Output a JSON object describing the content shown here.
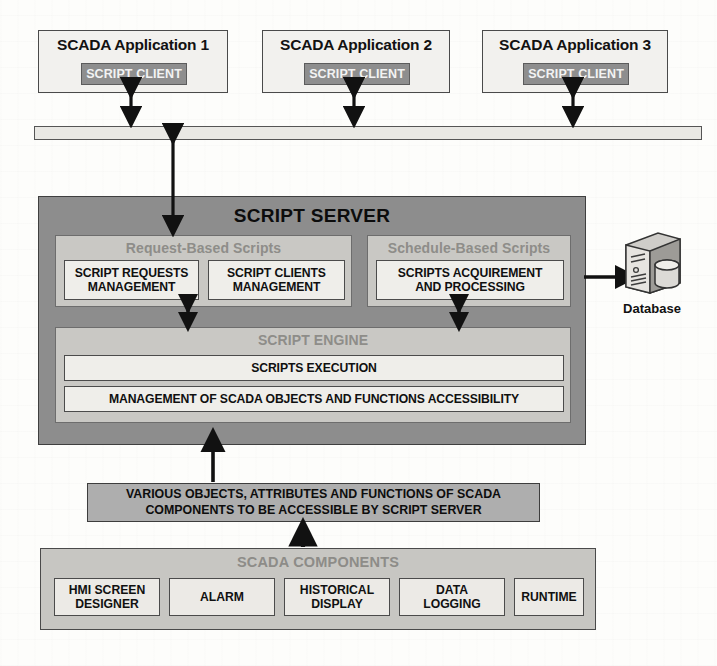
{
  "diagram": {
    "applications": [
      {
        "title": "SCADA Application 1",
        "client_label": "SCRIPT CLIENT"
      },
      {
        "title": "SCADA Application 2",
        "client_label": "SCRIPT CLIENT"
      },
      {
        "title": "SCADA Application 3",
        "client_label": "SCRIPT CLIENT"
      }
    ],
    "network_bus": {
      "label": ""
    },
    "script_server": {
      "title": "SCRIPT SERVER",
      "request_group": {
        "label": "Request-Based Scripts",
        "modules": [
          "SCRIPT REQUESTS MANAGEMENT",
          "SCRIPT CLIENTS MANAGEMENT"
        ],
        "module_lines": [
          [
            "SCRIPT REQUESTS",
            "MANAGEMENT"
          ],
          [
            "SCRIPT CLIENTS",
            "MANAGEMENT"
          ]
        ]
      },
      "schedule_group": {
        "label": "Schedule-Based Scripts",
        "modules": [
          "SCRIPTS ACQUIREMENT AND PROCESSING"
        ],
        "module_lines": [
          [
            "SCRIPTS ACQUIREMENT",
            "AND PROCESSING"
          ]
        ]
      },
      "script_engine": {
        "label": "SCRIPT ENGINE",
        "rows": [
          "SCRIPTS EXECUTION",
          "MANAGEMENT OF SCADA OBJECTS AND FUNCTIONS ACCESSIBILITY"
        ]
      }
    },
    "database": {
      "label": "Database",
      "icon": "database-server-icon"
    },
    "objects_bar": {
      "line1": "VARIOUS OBJECTS, ATTRIBUTES AND FUNCTIONS OF SCADA",
      "line2": "COMPONENTS TO BE ACCESSIBLE BY SCRIPT SERVER"
    },
    "scada_components": {
      "title": "SCADA COMPONENTS",
      "items": [
        {
          "line1": "HMI SCREEN",
          "line2": "DESIGNER"
        },
        {
          "line1": "ALARM",
          "line2": ""
        },
        {
          "line1": "HISTORICAL",
          "line2": "DISPLAY"
        },
        {
          "line1": "DATA",
          "line2": "LOGGING"
        },
        {
          "line1": "RUNTIME",
          "line2": ""
        }
      ]
    },
    "colors": {
      "app_box_fill": "#f2f1ee",
      "script_client_fill": "#8e8e8e",
      "bus_fill": "#e9e8e4",
      "server_fill": "#8d8d8d",
      "group_fill": "#c9c8c4",
      "inner_fill": "#efeeea",
      "objects_fill": "#aeaeae",
      "components_fill": "#c7c6c2",
      "stroke": "#3f3f3f",
      "muted_label": "#8e8d89"
    }
  }
}
